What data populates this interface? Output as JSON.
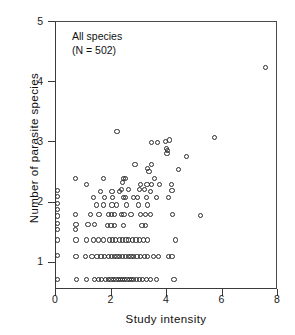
{
  "figure": {
    "annotation_line1": "All species",
    "annotation_line2": "(N = 502)"
  },
  "chart_data": {
    "type": "scatter",
    "title": "",
    "xlabel": "Study intensity",
    "ylabel": "Number of parasite species",
    "xlim": [
      0,
      8
    ],
    "ylim": [
      0.55,
      5
    ],
    "xticks": [
      0,
      2,
      4,
      6,
      8
    ],
    "yticks": [
      1,
      2,
      3,
      4,
      5
    ],
    "xtick_labels": [
      "0",
      "2",
      "4",
      "6",
      "8"
    ],
    "ytick_labels": [
      "1",
      "2",
      "3",
      "4",
      "5"
    ],
    "grid": false,
    "legend": null,
    "marker": "open-circle",
    "n_observations": 502,
    "annotations": [
      "All species",
      "(N = 502)"
    ],
    "points": [
      [
        7.55,
        4.25
      ],
      [
        5.7,
        3.08
      ],
      [
        2.2,
        3.18
      ],
      [
        3.45,
        3.0
      ],
      [
        3.65,
        3.0
      ],
      [
        3.95,
        3.02
      ],
      [
        4.1,
        3.04
      ],
      [
        3.98,
        2.9
      ],
      [
        4.02,
        2.86
      ],
      [
        4.0,
        2.82
      ],
      [
        4.7,
        2.77
      ],
      [
        2.85,
        2.64
      ],
      [
        3.45,
        2.64
      ],
      [
        3.3,
        2.57
      ],
      [
        3.35,
        2.52
      ],
      [
        4.4,
        2.55
      ],
      [
        0.7,
        2.4
      ],
      [
        1.7,
        2.4
      ],
      [
        2.42,
        2.4
      ],
      [
        2.5,
        2.4
      ],
      [
        3.55,
        2.4
      ],
      [
        1.1,
        2.3
      ],
      [
        2.4,
        2.33
      ],
      [
        3.05,
        2.3
      ],
      [
        3.28,
        2.3
      ],
      [
        3.45,
        2.3
      ],
      [
        3.72,
        2.3
      ],
      [
        4.15,
        2.3
      ],
      [
        2.35,
        2.22
      ],
      [
        2.62,
        2.22
      ],
      [
        3.0,
        2.22
      ],
      [
        3.2,
        2.22
      ],
      [
        0.05,
        2.2
      ],
      [
        1.6,
        2.18
      ],
      [
        2.02,
        2.18
      ],
      [
        2.3,
        2.18
      ],
      [
        3.4,
        2.18
      ],
      [
        4.18,
        2.2
      ],
      [
        0.05,
        2.1
      ],
      [
        1.35,
        2.08
      ],
      [
        1.75,
        2.08
      ],
      [
        2.05,
        2.08
      ],
      [
        2.42,
        2.08
      ],
      [
        2.5,
        2.08
      ],
      [
        2.78,
        2.08
      ],
      [
        2.95,
        2.08
      ],
      [
        3.25,
        2.08
      ],
      [
        3.62,
        2.08
      ],
      [
        4.05,
        2.08
      ],
      [
        0.05,
        1.98
      ],
      [
        1.45,
        1.96
      ],
      [
        1.72,
        1.96
      ],
      [
        2.02,
        1.96
      ],
      [
        2.18,
        1.96
      ],
      [
        2.55,
        1.96
      ],
      [
        2.98,
        1.96
      ],
      [
        3.3,
        1.96
      ],
      [
        0.05,
        1.88
      ],
      [
        0.7,
        1.8
      ],
      [
        1.25,
        1.8
      ],
      [
        1.55,
        1.8
      ],
      [
        1.9,
        1.8
      ],
      [
        2.0,
        1.8
      ],
      [
        2.12,
        1.8
      ],
      [
        2.35,
        1.8
      ],
      [
        2.45,
        1.8
      ],
      [
        2.7,
        1.8
      ],
      [
        3.05,
        1.8
      ],
      [
        3.22,
        1.8
      ],
      [
        3.4,
        1.8
      ],
      [
        4.2,
        1.8
      ],
      [
        0.05,
        1.78
      ],
      [
        5.2,
        1.79
      ],
      [
        0.05,
        1.66
      ],
      [
        0.72,
        1.64
      ],
      [
        1.15,
        1.64
      ],
      [
        1.38,
        1.64
      ],
      [
        1.85,
        1.62
      ],
      [
        1.98,
        1.62
      ],
      [
        2.1,
        1.62
      ],
      [
        2.42,
        1.62
      ],
      [
        3.1,
        1.62
      ],
      [
        3.22,
        1.62
      ],
      [
        0.05,
        1.56
      ],
      [
        0.7,
        1.55
      ],
      [
        0.05,
        1.38
      ],
      [
        0.72,
        1.38
      ],
      [
        1.1,
        1.38
      ],
      [
        1.35,
        1.38
      ],
      [
        1.52,
        1.38
      ],
      [
        1.7,
        1.38
      ],
      [
        1.92,
        1.38
      ],
      [
        2.05,
        1.38
      ],
      [
        2.15,
        1.38
      ],
      [
        2.28,
        1.38
      ],
      [
        2.4,
        1.38
      ],
      [
        2.52,
        1.38
      ],
      [
        2.62,
        1.38
      ],
      [
        2.75,
        1.38
      ],
      [
        2.88,
        1.38
      ],
      [
        3.0,
        1.38
      ],
      [
        3.15,
        1.38
      ],
      [
        3.3,
        1.38
      ],
      [
        4.3,
        1.38
      ],
      [
        0.05,
        1.12
      ],
      [
        0.72,
        1.1
      ],
      [
        1.05,
        1.1
      ],
      [
        1.3,
        1.1
      ],
      [
        1.48,
        1.1
      ],
      [
        1.62,
        1.1
      ],
      [
        1.75,
        1.1
      ],
      [
        1.88,
        1.1
      ],
      [
        2.0,
        1.1
      ],
      [
        2.1,
        1.1
      ],
      [
        2.2,
        1.1
      ],
      [
        2.3,
        1.1
      ],
      [
        2.4,
        1.1
      ],
      [
        2.5,
        1.1
      ],
      [
        2.6,
        1.1
      ],
      [
        2.7,
        1.1
      ],
      [
        2.8,
        1.1
      ],
      [
        2.92,
        1.1
      ],
      [
        3.05,
        1.1
      ],
      [
        3.18,
        1.1
      ],
      [
        3.3,
        1.1
      ],
      [
        3.52,
        1.1
      ],
      [
        3.7,
        1.1
      ],
      [
        4.05,
        1.1
      ],
      [
        4.18,
        1.1
      ],
      [
        0.05,
        0.72
      ],
      [
        0.75,
        0.72
      ],
      [
        1.1,
        0.72
      ],
      [
        1.38,
        0.72
      ],
      [
        1.52,
        0.72
      ],
      [
        1.65,
        0.72
      ],
      [
        1.78,
        0.72
      ],
      [
        1.88,
        0.72
      ],
      [
        1.98,
        0.72
      ],
      [
        2.08,
        0.72
      ],
      [
        2.16,
        0.72
      ],
      [
        2.24,
        0.72
      ],
      [
        2.32,
        0.72
      ],
      [
        2.4,
        0.72
      ],
      [
        2.48,
        0.72
      ],
      [
        2.56,
        0.72
      ],
      [
        2.64,
        0.72
      ],
      [
        2.72,
        0.72
      ],
      [
        2.8,
        0.72
      ],
      [
        2.9,
        0.72
      ],
      [
        3.0,
        0.72
      ],
      [
        3.12,
        0.72
      ],
      [
        3.25,
        0.72
      ],
      [
        3.4,
        0.72
      ],
      [
        3.62,
        0.72
      ],
      [
        4.25,
        0.72
      ]
    ]
  }
}
